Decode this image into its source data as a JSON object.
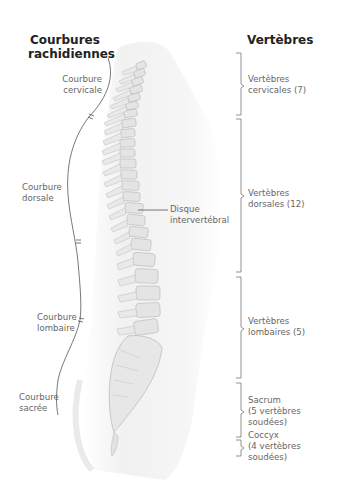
{
  "titles": {
    "left": [
      "Courbures",
      "rachidiennes"
    ],
    "right": "Vertèbres"
  },
  "curvatures": [
    {
      "id": "cervical",
      "lines": [
        "Courbure",
        "cervicale"
      ]
    },
    {
      "id": "dorsal",
      "lines": [
        "Courbure",
        "dorsale"
      ]
    },
    {
      "id": "lumbar",
      "lines": [
        "Courbure",
        "lombaire"
      ]
    },
    {
      "id": "sacral",
      "lines": [
        "Courbure",
        "sacrée"
      ]
    }
  ],
  "vertebrae": [
    {
      "id": "cervical",
      "lines": [
        "Vertèbres",
        "cervicales (7)"
      ]
    },
    {
      "id": "dorsal",
      "lines": [
        "Vertèbres",
        "dorsales (12)"
      ]
    },
    {
      "id": "lumbar",
      "lines": [
        "Vertèbres",
        "lombaires (5)"
      ]
    },
    {
      "id": "sacrum",
      "lines": [
        "Sacrum",
        "(5 vertèbres soudées)"
      ]
    },
    {
      "id": "coccyx",
      "lines": [
        "Coccyx",
        "(4 vertèbres soudées)"
      ]
    }
  ],
  "callout": {
    "lines": [
      "Disque",
      "intervertébral"
    ]
  },
  "colors": {
    "title": "#222222",
    "label": "#666666",
    "line": "#555555",
    "bone_fill": "#e6e6e6",
    "bone_stroke": "#b8b8b8",
    "body_shade": "#f2f2f2"
  }
}
